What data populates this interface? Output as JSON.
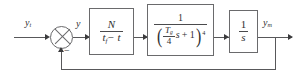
{
  "diagram": {
    "type": "control-block-diagram",
    "line_color": "#58585a",
    "text_color": "#2f2f31",
    "background": "#ffffff"
  },
  "signals": {
    "input_label": "y",
    "input_subscript": "t",
    "error_label": "y",
    "output_label": "y",
    "output_subscript": "m",
    "feedback_sign": "−"
  },
  "summing_junction": {
    "name": "summing-junction",
    "glyph": "circle-with-x",
    "inputs": 2,
    "signs": [
      "+",
      "−"
    ]
  },
  "blocks": [
    {
      "id": "gain-block",
      "numerator": "N",
      "denominator_base": "t",
      "denominator_subscript": "f",
      "denominator_rest": "− t",
      "expression": "N / (t_f − t)"
    },
    {
      "id": "lag-block",
      "numerator": "1",
      "denominator_open": "(",
      "denominator_frac_num": "T",
      "denominator_frac_subscript": "g",
      "denominator_frac_den": "4",
      "denominator_var": "s",
      "denominator_plus": "+ 1",
      "denominator_close": ")",
      "exponent": "4",
      "expression": "1 / ((T_g/4 · s + 1)^4)"
    },
    {
      "id": "integrator-block",
      "numerator": "1",
      "denominator": "s",
      "expression": "1 / s"
    }
  ],
  "feedback": {
    "id": "feedback-path",
    "label": "unity feedback",
    "gain": "1"
  }
}
